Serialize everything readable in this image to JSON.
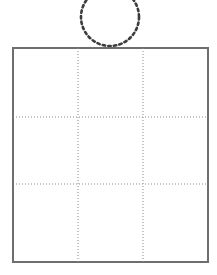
{
  "figure": {
    "title": "",
    "background_color": "#ffffff",
    "width": 217,
    "height": 275
  },
  "shapes": {
    "grid_rect": {
      "name": "nine-cell-grid",
      "x": 13,
      "y": 48,
      "width": 195,
      "height": 214,
      "stroke_color": "#6e6e6e",
      "stroke_width": 1.6,
      "fill": "#ffffff",
      "columns": 3,
      "rows": 3
    },
    "grid_lines": {
      "name": "dotted-grid-lines",
      "stroke_color": "#8a8a8a",
      "stroke_width": 1,
      "dash_pattern": "1 2",
      "vertical_x": [
        78,
        143
      ],
      "horizontal_y": [
        117,
        184
      ]
    },
    "circle": {
      "name": "dotted-circle",
      "center_x": 110,
      "center_y": 17,
      "radius": 29,
      "stroke_color": "#3c3c3c",
      "stroke_width": 2.6,
      "dash_pattern": "2.4 3.2",
      "fill": "none",
      "clipped_at_top": true
    }
  },
  "cells": [
    {
      "id": "cell-r1c1",
      "row": 1,
      "col": 1,
      "label": ""
    },
    {
      "id": "cell-r1c2",
      "row": 1,
      "col": 2,
      "label": ""
    },
    {
      "id": "cell-r1c3",
      "row": 1,
      "col": 3,
      "label": ""
    },
    {
      "id": "cell-r2c1",
      "row": 2,
      "col": 1,
      "label": ""
    },
    {
      "id": "cell-r2c2",
      "row": 2,
      "col": 2,
      "label": ""
    },
    {
      "id": "cell-r2c3",
      "row": 2,
      "col": 3,
      "label": ""
    },
    {
      "id": "cell-r3c1",
      "row": 3,
      "col": 1,
      "label": ""
    },
    {
      "id": "cell-r3c2",
      "row": 3,
      "col": 2,
      "label": ""
    },
    {
      "id": "cell-r3c3",
      "row": 3,
      "col": 3,
      "label": ""
    }
  ]
}
